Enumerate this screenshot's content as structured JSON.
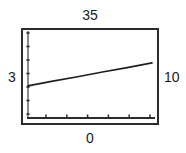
{
  "figure": {
    "background_color": "#ffffff",
    "frame_color": "#2b2b2b",
    "line_color": "#1f1f1f",
    "labels": {
      "top": "35",
      "left": "3",
      "right": "10",
      "bottom": "0"
    }
  },
  "chart_data": {
    "type": "line",
    "title": "",
    "subtitle": "",
    "xlabel": "0",
    "ylabel": "3",
    "annotations": [
      {
        "name": "top-value",
        "text": "35",
        "position": "top-center"
      },
      {
        "name": "left-value",
        "text": "3",
        "position": "left-middle"
      },
      {
        "name": "right-value",
        "text": "10",
        "position": "right-middle"
      },
      {
        "name": "bottom-value",
        "text": "0",
        "position": "bottom-center"
      }
    ],
    "legend": [],
    "legend_position": "none",
    "grid": false,
    "xlim": [
      0,
      10
    ],
    "ylim": [
      0,
      35
    ],
    "x_tick_count": 6,
    "y_tick_count": 7,
    "x_tick_labels": [],
    "y_tick_labels": [],
    "series": [
      {
        "name": "trend",
        "type": "line",
        "x": [
          0.0,
          2.0,
          4.0,
          6.0,
          8.0,
          10.0
        ],
        "y": [
          12.9,
          14.8,
          16.6,
          18.5,
          20.3,
          22.2
        ]
      },
      {
        "name": "baseline-axis",
        "type": "line",
        "x": [
          0.0,
          10.0
        ],
        "y": [
          0.0,
          0.0
        ]
      }
    ]
  }
}
